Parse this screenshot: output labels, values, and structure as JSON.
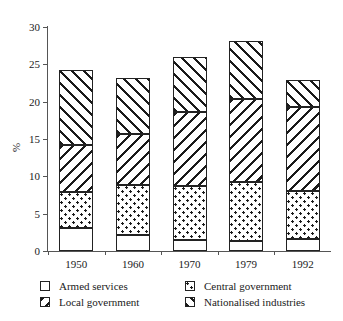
{
  "chart_data": {
    "type": "bar",
    "subtype": "stacked-bar",
    "title": "",
    "xlabel": "",
    "ylabel": "%",
    "ylim": [
      0,
      30
    ],
    "yticks": [
      0,
      5,
      10,
      15,
      20,
      25,
      30
    ],
    "ytick_labels": [
      "0",
      "5",
      "10",
      "15",
      "20",
      "25",
      "30"
    ],
    "grid": false,
    "legend_position": "bottom",
    "categories": [
      "1950",
      "1960",
      "1970",
      "1979",
      "1992"
    ],
    "series": [
      {
        "name": "Armed services",
        "pattern": "plain",
        "values": [
          3.1,
          2.2,
          1.5,
          1.4,
          1.6
        ]
      },
      {
        "name": "Central government",
        "pattern": "dots",
        "values": [
          4.8,
          6.6,
          7.2,
          7.8,
          6.5
        ]
      },
      {
        "name": "Local government",
        "pattern": "backslash-hatch",
        "values": [
          6.3,
          6.9,
          9.9,
          11.2,
          11.2
        ]
      },
      {
        "name": "Nationalised industries",
        "pattern": "slash-hatch",
        "values": [
          10.1,
          7.5,
          7.4,
          7.7,
          3.6
        ]
      }
    ],
    "cumulative_tops": {
      "1950": [
        3.1,
        7.9,
        14.2,
        24.3
      ],
      "1960": [
        2.2,
        8.8,
        15.7,
        23.2
      ],
      "1970": [
        1.5,
        8.7,
        18.6,
        26.0
      ],
      "1979": [
        1.4,
        9.2,
        20.4,
        28.1
      ],
      "1992": [
        1.6,
        8.1,
        19.3,
        22.9
      ]
    },
    "totals": [
      24.3,
      23.2,
      26.0,
      28.1,
      22.9
    ]
  },
  "legend": {
    "entries": [
      {
        "label": "Armed services",
        "pattern": "plain"
      },
      {
        "label": "Central government",
        "pattern": "dots"
      },
      {
        "label": "Local government",
        "pattern": "backslash-hatch"
      },
      {
        "label": "Nationalised industries",
        "pattern": "slash-hatch"
      }
    ]
  },
  "colors": {
    "ink": "#1a1a1a",
    "axis": "#555555",
    "background": "#ffffff"
  }
}
